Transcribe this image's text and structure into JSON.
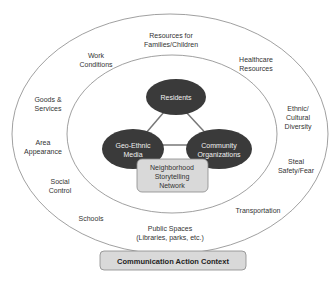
{
  "diagram": {
    "outer_factors": [
      {
        "id": "resources-families",
        "text": "Resources for\nFamilies/Children"
      },
      {
        "id": "work-conditions",
        "text": "Work\nConditions"
      },
      {
        "id": "healthcare-resources",
        "text": "Healthcare\nResources"
      },
      {
        "id": "goods-services",
        "text": "Goods &\nServices"
      },
      {
        "id": "ethnic-cultural-diversity",
        "text": "Ethnic/\nCultural\nDiversity"
      },
      {
        "id": "area-appearance",
        "text": "Area\nAppearance"
      },
      {
        "id": "steal-safety-fear",
        "text": "Steal\nSafety/Fear"
      },
      {
        "id": "social-control",
        "text": "Social\nControl"
      },
      {
        "id": "transportation",
        "text": "Transportation"
      },
      {
        "id": "schools",
        "text": "Schools"
      },
      {
        "id": "public-spaces",
        "text": "Public Spaces\n(Libraries, parks, etc.)"
      }
    ],
    "nodes": {
      "residents": "Residents",
      "geo_ethnic_media": "Geo-Ethnic\nMedia",
      "community_organizations": "Community\nOrganizations"
    },
    "network_box": "Neighborhood\nStorytelling\nNetwork",
    "context_box": "Communication Action Context",
    "colors": {
      "node_fill": "#3a3a3a",
      "box_fill": "#d9d9d9",
      "line": "#777777"
    }
  }
}
